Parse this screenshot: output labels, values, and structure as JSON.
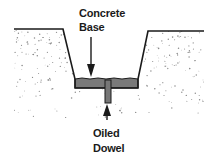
{
  "diagram": {
    "labels": {
      "concrete_base_line1": "Concrete",
      "concrete_base_line2": "Base",
      "dowel_line1": "Oiled",
      "dowel_line2": "Dowel"
    },
    "colors": {
      "ink": "#1a1a1a",
      "concrete": "#7a7a7a",
      "soil_speckle": "#8a8a8a",
      "background": "#ffffff"
    }
  }
}
